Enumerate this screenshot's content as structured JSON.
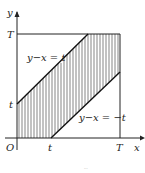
{
  "diagram": {
    "type": "region-plot",
    "axes": {
      "x_label": "x",
      "y_label": "y",
      "origin_label": "O"
    },
    "ticks": {
      "x": [
        "t",
        "T"
      ],
      "y": [
        "t",
        "T"
      ]
    },
    "lines": [
      {
        "equation": "y−x = t",
        "label": "y−x = t"
      },
      {
        "equation": "y−x = −t",
        "label": "y−x = −t"
      }
    ],
    "region": "band between y−x = t and y−x = −t within square [0,T]×[0,T], shaded with vertical hatching",
    "caption": "..."
  }
}
